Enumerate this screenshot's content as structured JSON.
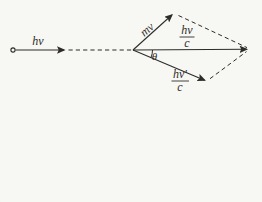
{
  "figure": {
    "incident_photon_label": "hν",
    "electron_momentum_label": "mv",
    "incident_momentum": {
      "numerator": "hν",
      "denominator": "c"
    },
    "scattered_momentum": {
      "numerator": "hν′",
      "denominator": "c"
    },
    "scattering_angle_label": "θ",
    "colors": {
      "ink": "#2e2c29",
      "paper": "#f7f7f4"
    }
  }
}
